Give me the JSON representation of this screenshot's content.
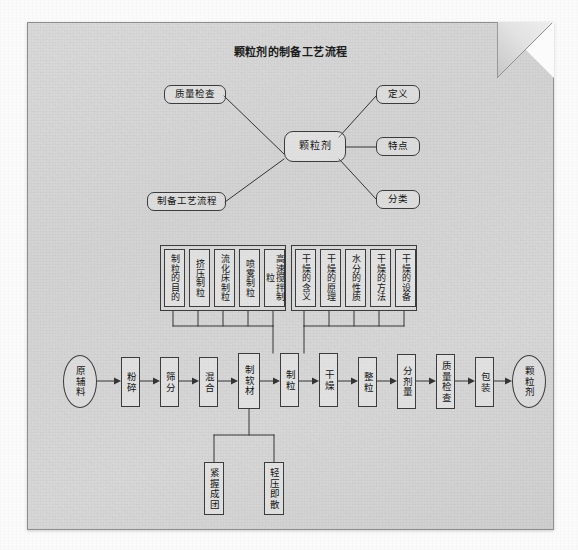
{
  "document": {
    "title": "颗粒剂的制备工艺流程",
    "paper_color": "#d5d5d5",
    "ink_color": "#141414"
  },
  "mindmap": {
    "hub": {
      "label": "颗粒剂"
    },
    "branches": [
      {
        "id": "quality-inspection",
        "label": "质量检查"
      },
      {
        "id": "definition",
        "label": "定义"
      },
      {
        "id": "features",
        "label": "特点"
      },
      {
        "id": "classification",
        "label": "分类"
      },
      {
        "id": "process-flow",
        "label": "制备工艺流程"
      }
    ]
  },
  "granulation_group": {
    "caption": "制粒",
    "items": [
      {
        "label": "制粒的目的"
      },
      {
        "label": "挤压制粒"
      },
      {
        "label": "流化床制粒"
      },
      {
        "label": "喷雾制粒"
      },
      {
        "label": "高速搅拌制粒"
      }
    ]
  },
  "drying_group": {
    "caption": "干燥",
    "items": [
      {
        "label": "干燥的含义"
      },
      {
        "label": "干燥的原理"
      },
      {
        "label": "水分的性质"
      },
      {
        "label": "干燥的方法"
      },
      {
        "label": "干燥的设备"
      }
    ]
  },
  "process_chain": {
    "steps": [
      {
        "id": "raw-materials",
        "label": "原辅料",
        "shape": "ellipse"
      },
      {
        "id": "pulverizing",
        "label": "粉碎",
        "shape": "rect"
      },
      {
        "id": "sieving",
        "label": "筛分",
        "shape": "rect"
      },
      {
        "id": "mixing",
        "label": "混合",
        "shape": "rect"
      },
      {
        "id": "soft-material",
        "label": "制软材",
        "shape": "rect"
      },
      {
        "id": "granulating",
        "label": "制粒",
        "shape": "rect"
      },
      {
        "id": "drying",
        "label": "干燥",
        "shape": "rect"
      },
      {
        "id": "sizing",
        "label": "整粒",
        "shape": "rect"
      },
      {
        "id": "dose-dividing",
        "label": "分剂量",
        "shape": "rect"
      },
      {
        "id": "quality-inspection",
        "label": "质量检查",
        "shape": "rect"
      },
      {
        "id": "packaging",
        "label": "包装",
        "shape": "rect"
      },
      {
        "id": "granule-product",
        "label": "颗粒剂",
        "shape": "ellipse"
      }
    ]
  },
  "soft_material_criteria": {
    "items": [
      {
        "label": "紧握成团"
      },
      {
        "label": "轻压即散"
      }
    ]
  }
}
